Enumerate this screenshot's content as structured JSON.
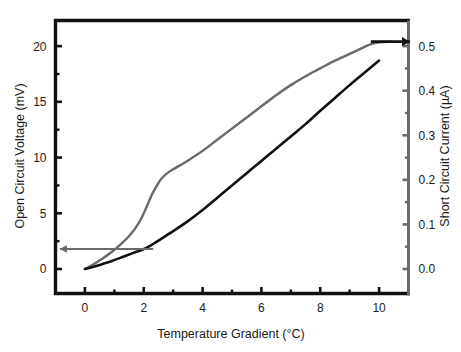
{
  "chart_data": {
    "type": "line",
    "title": "",
    "subtitle": "",
    "xlabel": "Temperature Gradient (°C)",
    "ylabel": "Open Circuit Voltage (mV)",
    "y2label": "Short Circuit Current (µA)",
    "xlim": [
      -1,
      11
    ],
    "ylim": [
      -2.2,
      22.3
    ],
    "y2lim": [
      -0.055,
      0.5575
    ],
    "grid": false,
    "legend": "none",
    "xticks": [
      0,
      2,
      4,
      6,
      8,
      10
    ],
    "xtick_labels": [
      "0",
      "2",
      "4",
      "6",
      "8",
      "10"
    ],
    "x_minor_ticks": [
      1,
      3,
      5,
      7,
      9,
      11
    ],
    "yticks": [
      0,
      5,
      10,
      15,
      20
    ],
    "ytick_labels": [
      "0",
      "5",
      "10",
      "15",
      "20"
    ],
    "y_minor_ticks": [
      2.5,
      7.5,
      12.5,
      17.5
    ],
    "y2ticks": [
      0.0,
      0.1,
      0.2,
      0.3,
      0.4,
      0.5
    ],
    "y2tick_labels": [
      "0.0",
      "0.1",
      "0.2",
      "0.3",
      "0.4",
      "0.5"
    ],
    "y2_minor_ticks": [
      0.05,
      0.15,
      0.25,
      0.35,
      0.45
    ],
    "series": [
      {
        "name": "Open Circuit Voltage",
        "axis": "left",
        "color": "#6a6a6a",
        "width": 2.4,
        "points": [
          [
            0.0,
            0.0
          ],
          [
            0.25,
            0.35
          ],
          [
            0.55,
            0.85
          ],
          [
            0.9,
            1.5
          ],
          [
            1.25,
            2.3
          ],
          [
            1.55,
            3.1
          ],
          [
            1.8,
            4.0
          ],
          [
            2.0,
            5.0
          ],
          [
            2.15,
            5.9
          ],
          [
            2.3,
            6.8
          ],
          [
            2.45,
            7.5
          ],
          [
            2.6,
            8.1
          ],
          [
            2.8,
            8.6
          ],
          [
            3.0,
            8.95
          ],
          [
            3.3,
            9.4
          ],
          [
            3.6,
            9.9
          ],
          [
            4.0,
            10.6
          ],
          [
            4.5,
            11.6
          ],
          [
            5.0,
            12.6
          ],
          [
            5.5,
            13.6
          ],
          [
            6.0,
            14.6
          ],
          [
            6.5,
            15.6
          ],
          [
            7.0,
            16.5
          ],
          [
            7.5,
            17.3
          ],
          [
            8.0,
            18.0
          ],
          [
            8.5,
            18.7
          ],
          [
            9.0,
            19.3
          ],
          [
            9.4,
            19.8
          ],
          [
            9.7,
            20.15
          ],
          [
            10.0,
            20.35
          ],
          [
            10.45,
            20.4
          ]
        ]
      },
      {
        "name": "Short Circuit Current",
        "axis": "right",
        "color": "#111111",
        "width": 2.6,
        "points": [
          [
            0.0,
            0.0
          ],
          [
            0.3,
            0.2
          ],
          [
            0.6,
            0.45
          ],
          [
            0.9,
            0.7
          ],
          [
            1.2,
            1.0
          ],
          [
            1.5,
            1.3
          ],
          [
            1.75,
            1.55
          ],
          [
            1.95,
            1.72
          ],
          [
            2.2,
            2.05
          ],
          [
            2.5,
            2.55
          ],
          [
            3.0,
            3.4
          ],
          [
            3.5,
            4.3
          ],
          [
            4.0,
            5.3
          ],
          [
            4.5,
            6.4
          ],
          [
            5.0,
            7.5
          ],
          [
            5.5,
            8.6
          ],
          [
            6.0,
            9.7
          ],
          [
            6.5,
            10.8
          ],
          [
            7.0,
            11.9
          ],
          [
            7.5,
            13.0
          ],
          [
            8.0,
            14.2
          ],
          [
            8.5,
            15.35
          ],
          [
            9.0,
            16.5
          ],
          [
            9.5,
            17.6
          ],
          [
            10.0,
            18.7
          ]
        ]
      }
    ],
    "annotations": [
      {
        "name": "left-arrow-annotation",
        "type": "arrow",
        "color": "#6a6a6a",
        "from_x": 2.32,
        "from_y": 1.8,
        "to_x": -0.85,
        "to_y": 1.8,
        "direction": "left",
        "axis": "left"
      },
      {
        "name": "right-arrow-annotation",
        "type": "arrow",
        "color": "#111111",
        "from_x": 9.72,
        "from_y": 20.4,
        "to_x": 11.05,
        "to_y": 20.4,
        "direction": "right",
        "axis": "left"
      }
    ]
  }
}
